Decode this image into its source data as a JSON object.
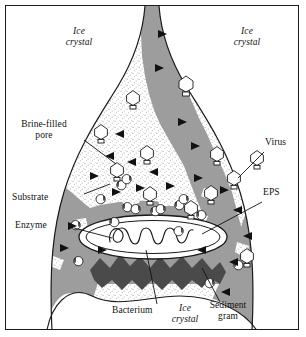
{
  "labels": {
    "ice_crystal_top_left": "Ice\ncrystal",
    "ice_crystal_top_left_line1": "Ice",
    "ice_crystal_top_left_line2": "crystal",
    "ice_crystal_top_right_line1": "Ice",
    "ice_crystal_top_right_line2": "crystal",
    "ice_crystal_bottom_line1": "Ice",
    "ice_crystal_bottom_line2": "crystal",
    "brine_filled_pore_line1": "Brine-filled",
    "brine_filled_pore_line2": "pore",
    "virus": "Virus",
    "eps": "EPS",
    "substrate": "Substrate",
    "enzyme": "Enzyme",
    "bacterium": "Bacterium",
    "sediment_grain_line1": "Sediment",
    "sediment_grain_line2": "gram"
  },
  "colors": {
    "outline": "#1a1a1a",
    "ice_white": "#ffffff",
    "brine_stipple_base": "#ffffff",
    "stipple_dot": "#8a8a8a",
    "eps_gray": "#9d9d9d",
    "sediment_dark_gray": "#4a4a4a",
    "substrate_black": "#111111",
    "virus_fill": "#ffffff",
    "enzyme_fill": "#ffffff",
    "frame_border": "#1a1a1a",
    "leader_line": "#111111"
  },
  "elements": {
    "viruses_count": 14,
    "substrate_triangles_count": 22,
    "enzymes_count": 16,
    "bacterium_shape": "ellipse with inner outline and coiled filament",
    "sediment_grain_shape": "jagged dark band",
    "eps_shape": "gray mottled region lining the pore"
  },
  "icons": {
    "virus": "virus-phage-icon",
    "substrate": "substrate-triangle-icon",
    "enzyme": "enzyme-pacman-icon",
    "bacterium": "bacterium-ellipse-icon",
    "sediment": "sediment-grain-icon"
  }
}
